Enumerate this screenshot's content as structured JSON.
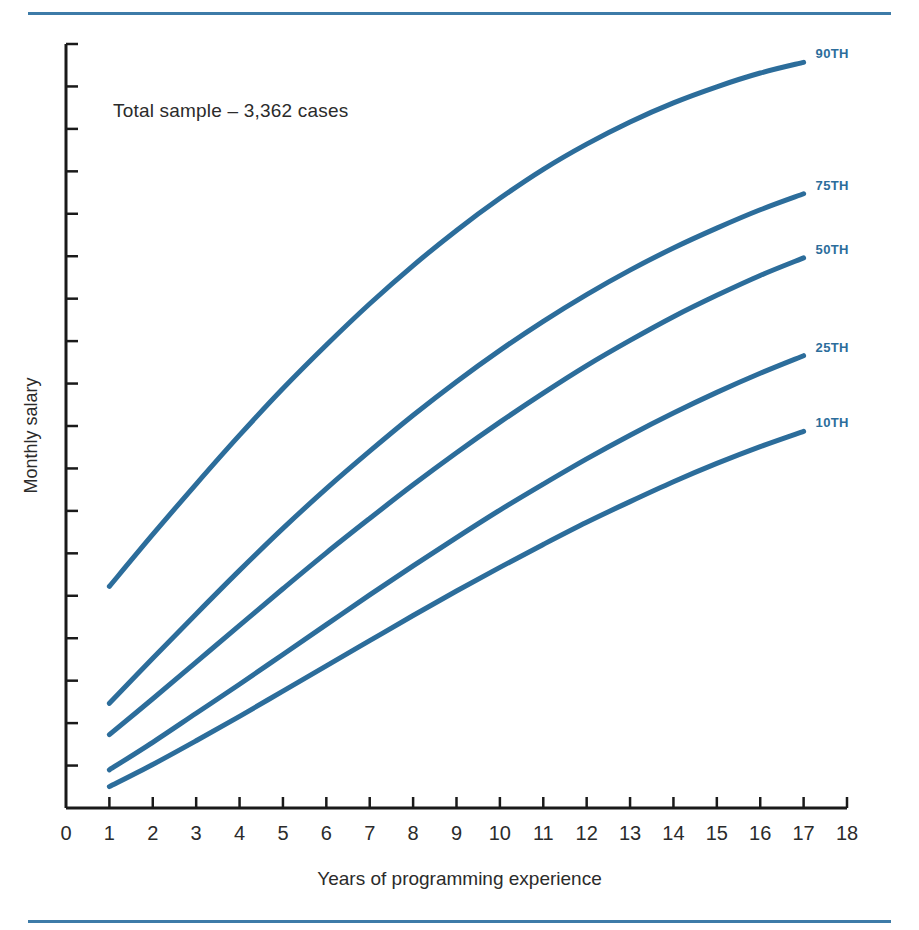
{
  "figure": {
    "annotation": "Total sample – 3,362 cases",
    "line_color": "#2c6d9b",
    "rule_color": "#3d7ba8",
    "axis_color": "#1a1a1a",
    "text_color": "#2b2b2b"
  },
  "chart_data": {
    "type": "line",
    "title": "",
    "subtitle": "",
    "annotation": "Total sample – 3,362 cases",
    "xlabel": "Years of programming experience",
    "ylabel": "Monthly salary",
    "xlim": [
      0,
      18
    ],
    "ylim": [
      0,
      100
    ],
    "xticks": [
      0,
      1,
      2,
      3,
      4,
      5,
      6,
      7,
      8,
      9,
      10,
      11,
      12,
      13,
      14,
      15,
      16,
      17,
      18
    ],
    "xtick_labels": [
      "0",
      "1",
      "2",
      "3",
      "4",
      "5",
      "6",
      "7",
      "8",
      "9",
      "10",
      "11",
      "12",
      "13",
      "14",
      "15",
      "16",
      "17",
      "18"
    ],
    "ytick_labels": [],
    "ytick_count": 17,
    "y_axis_unlabeled": true,
    "grid": false,
    "legend_position": "right-inline-endpoint-labels",
    "x": [
      1,
      2,
      3,
      4,
      5,
      6,
      7,
      8,
      9,
      10,
      11,
      12,
      13,
      14,
      15,
      16,
      17
    ],
    "series": [
      {
        "name": "90TH",
        "label": "90TH",
        "color": "#2c6d9b",
        "values": [
          29.0,
          35.8,
          42.4,
          48.8,
          54.9,
          60.6,
          66.0,
          71.0,
          75.6,
          79.8,
          83.6,
          86.9,
          89.8,
          92.3,
          94.4,
          96.2,
          97.6
        ]
      },
      {
        "name": "75TH",
        "label": "75TH",
        "color": "#2c6d9b",
        "values": [
          13.7,
          19.6,
          25.4,
          31.1,
          36.6,
          41.8,
          46.7,
          51.4,
          55.8,
          59.9,
          63.7,
          67.2,
          70.4,
          73.3,
          75.9,
          78.3,
          80.4
        ]
      },
      {
        "name": "50TH",
        "label": "50TH",
        "color": "#2c6d9b",
        "values": [
          9.6,
          14.3,
          19.1,
          23.9,
          28.7,
          33.4,
          37.9,
          42.3,
          46.5,
          50.5,
          54.3,
          57.9,
          61.2,
          64.3,
          67.1,
          69.7,
          72.0
        ]
      },
      {
        "name": "25TH",
        "label": "25TH",
        "color": "#2c6d9b",
        "values": [
          5.0,
          8.6,
          12.4,
          16.2,
          20.1,
          24.0,
          27.9,
          31.7,
          35.4,
          39.0,
          42.4,
          45.7,
          48.8,
          51.7,
          54.4,
          56.9,
          59.2
        ]
      },
      {
        "name": "10TH",
        "label": "10TH",
        "color": "#2c6d9b",
        "values": [
          2.8,
          5.7,
          8.8,
          12.0,
          15.3,
          18.6,
          21.9,
          25.2,
          28.4,
          31.5,
          34.5,
          37.4,
          40.1,
          42.7,
          45.1,
          47.3,
          49.3
        ]
      }
    ]
  }
}
